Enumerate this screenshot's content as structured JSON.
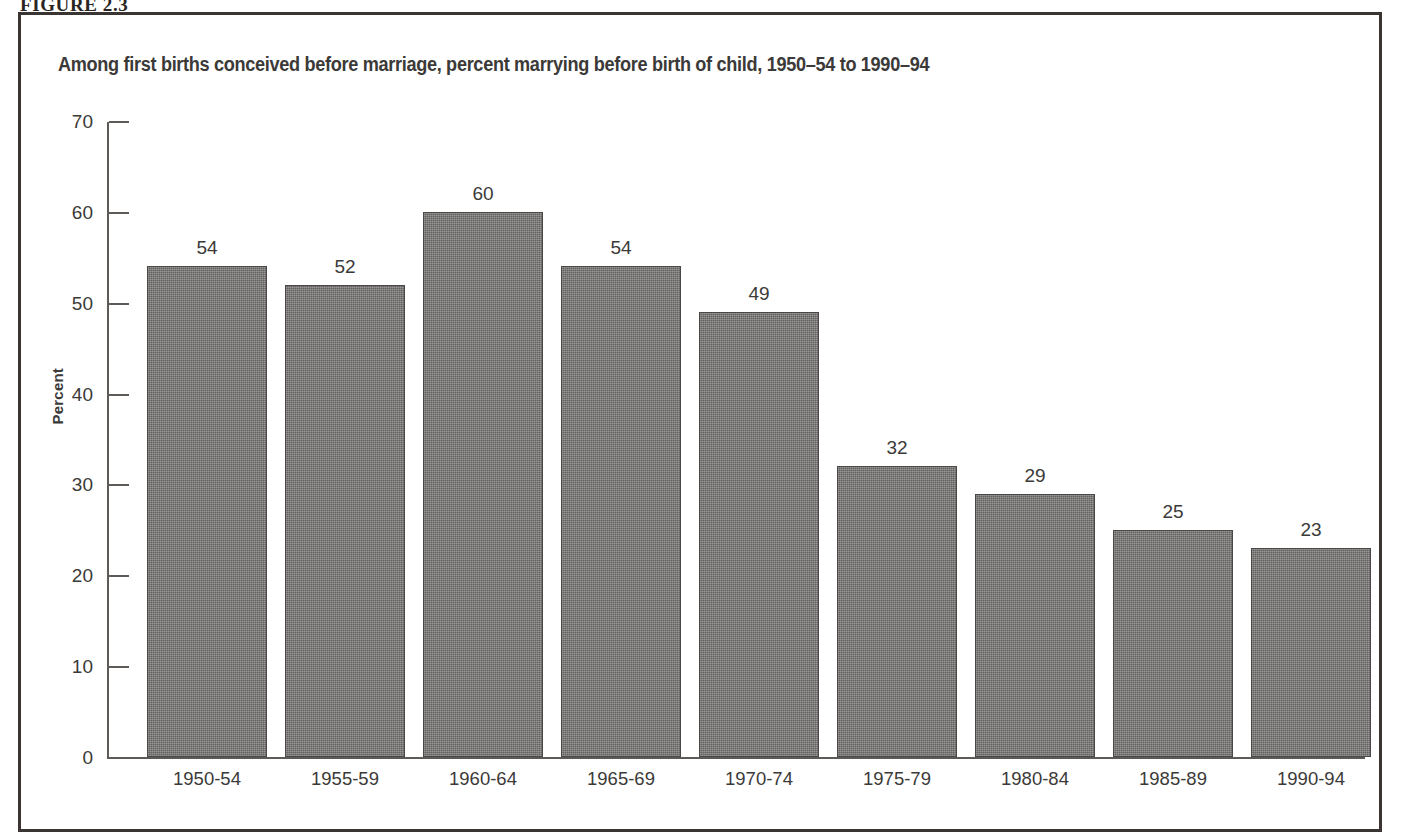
{
  "figure": {
    "number_label": "FIGURE 2.3"
  },
  "chart_data": {
    "type": "bar",
    "title": "Among first births conceived before marriage, percent marrying before birth of child, 1950–54 to 1990–94",
    "xlabel": "",
    "ylabel": "Percent",
    "ylim": [
      0,
      70
    ],
    "ytick_step": 10,
    "ytick_labels": [
      "0",
      "10",
      "20",
      "30",
      "40",
      "50",
      "60",
      "70"
    ],
    "grid": false,
    "legend": null,
    "categories": [
      "1950-54",
      "1955-59",
      "1960-64",
      "1965-69",
      "1970-74",
      "1975-79",
      "1980-84",
      "1985-89",
      "1990-94"
    ],
    "values": [
      54,
      52,
      60,
      54,
      49,
      32,
      29,
      25,
      23
    ],
    "value_labels": [
      "54",
      "52",
      "60",
      "54",
      "49",
      "32",
      "29",
      "25",
      "23"
    ],
    "bar_color": "#6f6d6b",
    "bar_border_color": "#4a4744",
    "axis_color": "#5d5a57",
    "text_color": "#3b3a38"
  }
}
